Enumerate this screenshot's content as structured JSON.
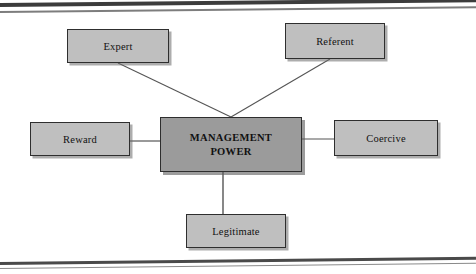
{
  "document": {
    "kind": "scanned-textbook-figure",
    "background_color": "#ffffff",
    "border_color": "#3c3c3c"
  },
  "diagram": {
    "type": "hub-and-spoke",
    "hub": {
      "id": "management-power",
      "label_line1": "MANAGEMENT",
      "label_line2": "POWER",
      "fill_color": "#9b9b9b",
      "border_color": "#2e2e2e",
      "text_color": "#111111",
      "bold": true
    },
    "satellites": [
      {
        "id": "expert",
        "label": "Expert",
        "position": "top-left",
        "fill_color": "#bfbfbf",
        "connector": "diagonal"
      },
      {
        "id": "referent",
        "label": "Referent",
        "position": "top-right",
        "fill_color": "#bfbfbf",
        "connector": "diagonal"
      },
      {
        "id": "reward",
        "label": "Reward",
        "position": "left",
        "fill_color": "#bfbfbf",
        "connector": "horizontal"
      },
      {
        "id": "coercive",
        "label": "Coercive",
        "position": "right",
        "fill_color": "#bfbfbf",
        "connector": "horizontal"
      },
      {
        "id": "legitimate",
        "label": "Legitimate",
        "position": "bottom",
        "fill_color": "#bfbfbf",
        "connector": "vertical"
      }
    ],
    "connectors": [
      {
        "id": "expert-to-hub",
        "from": "expert",
        "to": "management-power",
        "x1": 118,
        "y1": 49,
        "x2": 231,
        "y2": 103
      },
      {
        "id": "referent-to-hub",
        "from": "referent",
        "to": "management-power",
        "x1": 330,
        "y1": 45,
        "x2": 231,
        "y2": 103
      },
      {
        "id": "reward-to-hub",
        "from": "reward",
        "to": "management-power",
        "x1": 130,
        "y1": 127,
        "x2": 160,
        "y2": 127
      },
      {
        "id": "coercive-to-hub",
        "from": "coercive",
        "to": "management-power",
        "x1": 302,
        "y1": 125,
        "x2": 334,
        "y2": 125
      },
      {
        "id": "legitimate-to-hub",
        "from": "legitimate",
        "to": "management-power",
        "x1": 223,
        "y1": 158,
        "x2": 223,
        "y2": 200
      }
    ],
    "connector_color": "#555555"
  }
}
